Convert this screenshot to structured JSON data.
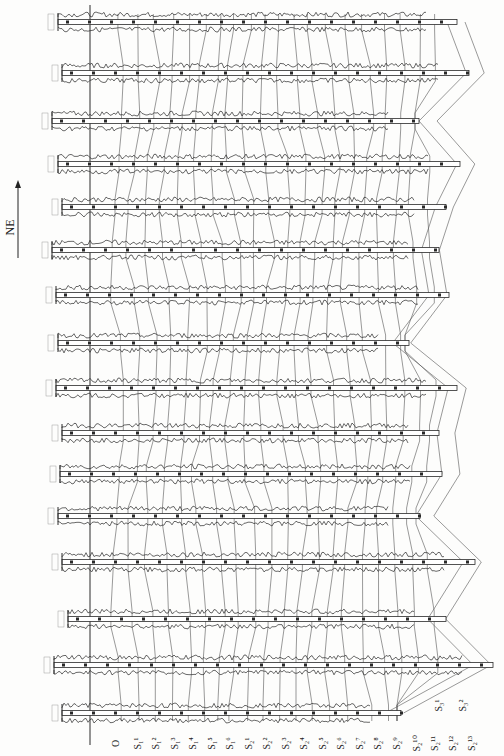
{
  "figure": {
    "type": "well-log correlation section (rotated 90°)",
    "orientation_label": "NE",
    "well_count": 16,
    "wells": [
      {
        "y": 22,
        "x0": 58,
        "x1": 457
      },
      {
        "y": 73,
        "x0": 62,
        "x1": 469
      },
      {
        "y": 121,
        "x0": 52,
        "x1": 419
      },
      {
        "y": 164,
        "x0": 58,
        "x1": 460
      },
      {
        "y": 207,
        "x0": 62,
        "x1": 446
      },
      {
        "y": 250,
        "x0": 52,
        "x1": 439
      },
      {
        "y": 295,
        "x0": 56,
        "x1": 449
      },
      {
        "y": 343,
        "x0": 58,
        "x1": 409
      },
      {
        "y": 388,
        "x0": 56,
        "x1": 457
      },
      {
        "y": 433,
        "x0": 62,
        "x1": 439
      },
      {
        "y": 474,
        "x0": 60,
        "x1": 442
      },
      {
        "y": 516,
        "x0": 58,
        "x1": 420
      },
      {
        "y": 562,
        "x0": 62,
        "x1": 475
      },
      {
        "y": 619,
        "x0": 68,
        "x1": 446
      },
      {
        "y": 665,
        "x0": 54,
        "x1": 493
      },
      {
        "y": 713,
        "x0": 62,
        "x1": 401
      }
    ],
    "horizon_labels_bottom": [
      "O",
      "S₁¹",
      "S₁²",
      "S₁³",
      "S₁⁴",
      "S₁⁵",
      "S₁⁶",
      "S₂¹",
      "S₂²",
      "S₂³",
      "S₂⁴",
      "S₂⁵",
      "S₂⁶",
      "S₂⁷",
      "S₂⁸",
      "S₂⁹",
      "S₂¹⁰",
      "S₂¹¹",
      "S₂¹²",
      "S₂¹³"
    ],
    "horizon_labels_right": [
      "S₃¹",
      "S₃²"
    ],
    "colors": {
      "ink": "#2a2a2a",
      "paper": "#fdfdfc",
      "correlation_line": "#555555"
    }
  }
}
